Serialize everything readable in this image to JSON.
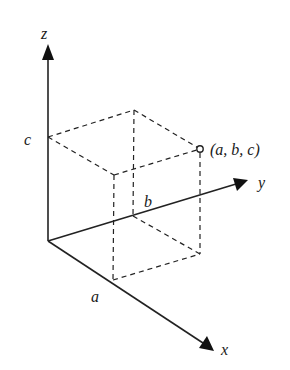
{
  "diagram": {
    "type": "3d-coordinate-point",
    "axes": {
      "x": {
        "label": "x"
      },
      "y": {
        "label": "y"
      },
      "z": {
        "label": "z"
      }
    },
    "intercepts": {
      "a": "a",
      "b": "b",
      "c": "c"
    },
    "point": {
      "label": "(a, b, c)"
    },
    "colors": {
      "line": "#222222",
      "background": "#ffffff"
    }
  }
}
